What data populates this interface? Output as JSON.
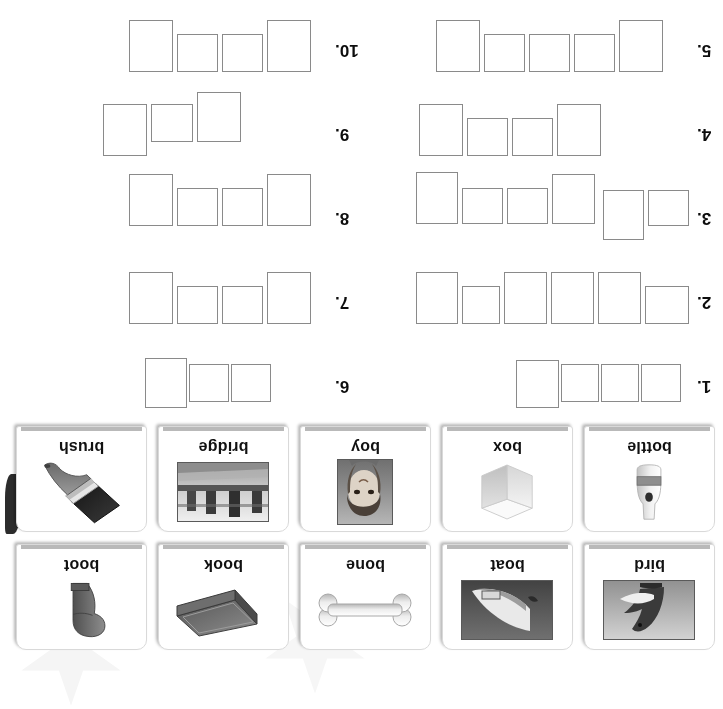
{
  "worksheet": {
    "rotation_note": "sheet-appears-upside-down",
    "accent_color": "#111111",
    "box_border_color": "#8a8a8a",
    "questions": [
      {
        "number": "1.",
        "box_count": 4,
        "column": "right"
      },
      {
        "number": "2.",
        "box_count": 6,
        "column": "right"
      },
      {
        "number": "3.",
        "box_count": 6,
        "column": "right"
      },
      {
        "number": "4.",
        "box_count": 4,
        "column": "right"
      },
      {
        "number": "5.",
        "box_count": 5,
        "column": "right"
      },
      {
        "number": "6.",
        "box_count": 3,
        "column": "left"
      },
      {
        "number": "7.",
        "box_count": 4,
        "column": "left"
      },
      {
        "number": "8.",
        "box_count": 4,
        "column": "left"
      },
      {
        "number": "9.",
        "box_count": 3,
        "column": "left"
      },
      {
        "number": "10.",
        "box_count": 4,
        "column": "left"
      }
    ]
  },
  "word_bank": {
    "row_top": [
      {
        "label": "bird",
        "icon": "bird-photo"
      },
      {
        "label": "boat",
        "icon": "boat-photo"
      },
      {
        "label": "bone",
        "icon": "bone-illustration"
      },
      {
        "label": "book",
        "icon": "book-illustration"
      },
      {
        "label": "boot",
        "icon": "boot-illustration"
      }
    ],
    "row_bottom": [
      {
        "label": "bottle",
        "icon": "bottle-illustration"
      },
      {
        "label": "box",
        "icon": "box-illustration"
      },
      {
        "label": "boy",
        "icon": "boy-photo"
      },
      {
        "label": "bridge",
        "icon": "bridge-photo"
      },
      {
        "label": "brush",
        "icon": "brush-illustration"
      }
    ]
  }
}
